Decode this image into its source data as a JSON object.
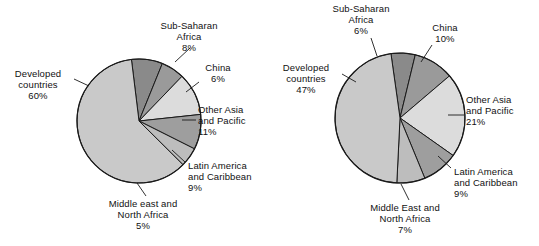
{
  "figure": {
    "background": "#ffffff",
    "text_color": "#111111",
    "stroke_color": "#1a1a1a"
  },
  "palette": {
    "developed": "#c9c9c9",
    "sub_saharan": "#8a8a8a",
    "china": "#9a9a9a",
    "other_asia": "#dcdcdc",
    "latin_america": "#9e9e9e",
    "middle_east": "#bdbdbd"
  },
  "chart_data": [
    {
      "type": "pie",
      "name": "left-pie",
      "title": "",
      "legend": "none",
      "labels": [
        "Developed countries",
        "Sub-Saharan Africa",
        "China",
        "Other Asia and Pacific",
        "Latin America and Caribbean",
        "Middle east and North Africa"
      ],
      "values": [
        60,
        8,
        6,
        11,
        9,
        5
      ],
      "value_labels": [
        "60%",
        "8%",
        "6%",
        "11%",
        "9%",
        "5%"
      ],
      "slices": [
        {
          "id": "sub-saharan-africa",
          "name_lines": [
            "Sub-Saharan",
            "Africa"
          ],
          "value": 8,
          "value_label": "8%",
          "color": "#8a8a8a"
        },
        {
          "id": "china",
          "name_lines": [
            "China"
          ],
          "value": 6,
          "value_label": "6%",
          "color": "#9a9a9a"
        },
        {
          "id": "other-asia-and-pacific",
          "name_lines": [
            "Other Asia",
            "and Pacific"
          ],
          "value": 11,
          "value_label": "11%",
          "color": "#dcdcdc"
        },
        {
          "id": "latin-america-and-caribbean",
          "name_lines": [
            "Latin America",
            "and Caribbean"
          ],
          "value": 9,
          "value_label": "9%",
          "color": "#9e9e9e"
        },
        {
          "id": "middle-east-and-north-africa",
          "name_lines": [
            "Middle east and",
            "North Africa"
          ],
          "value": 5,
          "value_label": "5%",
          "color": "#bdbdbd"
        },
        {
          "id": "developed-countries",
          "name_lines": [
            "Developed",
            "countries"
          ],
          "value": 60,
          "value_label": "60%",
          "color": "#c9c9c9"
        }
      ]
    },
    {
      "type": "pie",
      "name": "right-pie",
      "title": "",
      "legend": "none",
      "labels": [
        "Developed countries",
        "Sub-Saharan Africa",
        "China",
        "Other Asia and Pacific",
        "Latin America and Caribbean",
        "Middle East and North Africa"
      ],
      "values": [
        47,
        6,
        10,
        21,
        9,
        7
      ],
      "value_labels": [
        "47%",
        "6%",
        "10%",
        "21%",
        "9%",
        "7%"
      ],
      "slices": [
        {
          "id": "sub-saharan-africa",
          "name_lines": [
            "Sub-Saharan",
            "Africa"
          ],
          "value": 6,
          "value_label": "6%",
          "color": "#8a8a8a"
        },
        {
          "id": "china",
          "name_lines": [
            "China"
          ],
          "value": 10,
          "value_label": "10%",
          "color": "#9a9a9a"
        },
        {
          "id": "other-asia-and-pacific",
          "name_lines": [
            "Other Asia",
            "and Pacific"
          ],
          "value": 21,
          "value_label": "21%",
          "color": "#dcdcdc"
        },
        {
          "id": "latin-america-and-caribbean",
          "name_lines": [
            "Latin America",
            "and Caribbean"
          ],
          "value": 9,
          "value_label": "9%",
          "color": "#9e9e9e"
        },
        {
          "id": "middle-east-and-north-africa",
          "name_lines": [
            "Middle East and",
            "North Africa"
          ],
          "value": 7,
          "value_label": "7%",
          "color": "#bdbdbd"
        },
        {
          "id": "developed-countries",
          "name_lines": [
            "Developed",
            "countries"
          ],
          "value": 47,
          "value_label": "47%",
          "color": "#c9c9c9"
        }
      ]
    }
  ],
  "left": {
    "geometry": {
      "cx": 139,
      "cy": 121,
      "r": 62,
      "start_angle_deg": -7
    },
    "labels": {
      "developed": {
        "lines": [
          "Developed",
          "countries"
        ],
        "pct": "60%",
        "x": 2,
        "y": 68,
        "align": "ctr",
        "w": 72
      },
      "sub_saharan": {
        "lines": [
          "Sub-Saharan",
          "Africa"
        ],
        "pct": "8%",
        "x": 150,
        "y": 20,
        "align": "ctr",
        "w": 78
      },
      "china": {
        "lines": [
          "China"
        ],
        "pct": "6%",
        "x": 196,
        "y": 62,
        "align": "ctr",
        "w": 44
      },
      "other_asia": {
        "lines": [
          "Other Asia",
          "and Pacific"
        ],
        "pct": "11%",
        "x": 198,
        "y": 104,
        "align": "lft",
        "w": 72
      },
      "latin_america": {
        "lines": [
          "Latin America",
          "and Caribbean"
        ],
        "pct": "9%",
        "x": 188,
        "y": 160,
        "align": "lft",
        "w": 84
      },
      "middle_east": {
        "lines": [
          "Middle east and",
          "North Africa"
        ],
        "pct": "5%",
        "x": 94,
        "y": 198,
        "align": "ctr",
        "w": 98
      }
    },
    "leaders": [
      {
        "name": "leader-developed",
        "x1": 74,
        "y1": 79,
        "x2": 89,
        "y2": 86
      },
      {
        "name": "leader-sub-saharan",
        "x1": 190,
        "y1": 48,
        "x2": 175,
        "y2": 62
      },
      {
        "name": "leader-china",
        "x1": 199,
        "y1": 82,
        "x2": 186,
        "y2": 92
      },
      {
        "name": "leader-other-asia",
        "x1": 196,
        "y1": 120,
        "x2": 182,
        "y2": 120
      },
      {
        "name": "leader-latin-america",
        "x1": 185,
        "y1": 162,
        "x2": 172,
        "y2": 150
      },
      {
        "name": "leader-middle-east",
        "x1": 146,
        "y1": 196,
        "x2": 137,
        "y2": 183
      }
    ]
  },
  "right": {
    "geometry": {
      "cx": 130,
      "cy": 118,
      "r": 65,
      "start_angle_deg": -8
    },
    "labels": {
      "developed": {
        "lines": [
          "Developed",
          "countries"
        ],
        "pct": "47%",
        "x": 0,
        "y": 62,
        "align": "ctr",
        "w": 72
      },
      "sub_saharan": {
        "lines": [
          "Sub-Saharan",
          "Africa"
        ],
        "pct": "6%",
        "x": 52,
        "y": 3,
        "align": "ctr",
        "w": 78
      },
      "china": {
        "lines": [
          "China"
        ],
        "pct": "10%",
        "x": 150,
        "y": 22,
        "align": "ctr",
        "w": 50
      },
      "other_asia": {
        "lines": [
          "Other Asia",
          "and Pacific"
        ],
        "pct": "21%",
        "x": 196,
        "y": 94,
        "align": "lft",
        "w": 72
      },
      "latin_america": {
        "lines": [
          "Latin America",
          "and Caribbean"
        ],
        "pct": "9%",
        "x": 184,
        "y": 166,
        "align": "lft",
        "w": 84
      },
      "middle_east": {
        "lines": [
          "Middle East and",
          "North Africa"
        ],
        "pct": "7%",
        "x": 86,
        "y": 202,
        "align": "ctr",
        "w": 98
      }
    },
    "leaders": [
      {
        "name": "leader-developed",
        "x1": 72,
        "y1": 74,
        "x2": 86,
        "y2": 82
      },
      {
        "name": "leader-sub-saharan",
        "x1": 101,
        "y1": 38,
        "x2": 107,
        "y2": 56
      },
      {
        "name": "leader-china",
        "x1": 162,
        "y1": 45,
        "x2": 151,
        "y2": 62
      },
      {
        "name": "leader-other-asia",
        "x1": 194,
        "y1": 115,
        "x2": 178,
        "y2": 115
      },
      {
        "name": "leader-latin-america",
        "x1": 181,
        "y1": 168,
        "x2": 168,
        "y2": 156
      },
      {
        "name": "leader-middle-east",
        "x1": 139,
        "y1": 200,
        "x2": 131,
        "y2": 184
      }
    ]
  }
}
